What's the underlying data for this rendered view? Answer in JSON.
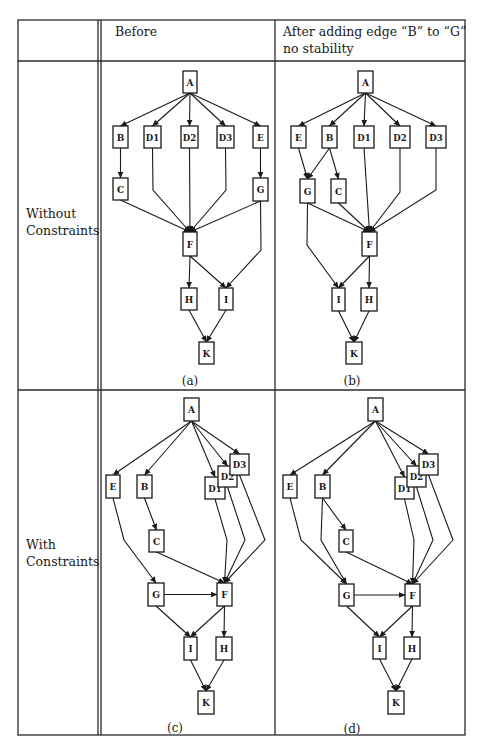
{
  "table": {
    "header": {
      "col1": "",
      "col2": "Before",
      "col3_line1": "After adding edge “B” to “G”",
      "col3_line2": "no stability"
    },
    "rows": [
      {
        "label_line1": "Without",
        "label_line2": "Constraints"
      },
      {
        "label_line1": "With",
        "label_line2": "Constraints"
      }
    ]
  },
  "graphs": [
    {
      "id": "a",
      "caption": "(a)",
      "caption_pos": [
        190,
        381
      ],
      "nodes": {
        "A": [
          183,
          71,
          14,
          22
        ],
        "B": [
          113,
          126,
          15,
          22
        ],
        "D1": [
          144,
          126,
          17,
          22
        ],
        "D2": [
          181,
          126,
          17,
          22
        ],
        "D3": [
          217,
          126,
          17,
          22
        ],
        "E": [
          253,
          126,
          15,
          22
        ],
        "C": [
          113,
          178,
          15,
          22
        ],
        "G": [
          253,
          178,
          15,
          23
        ],
        "F": [
          183,
          232,
          14,
          24
        ],
        "H": [
          181,
          288,
          16,
          22
        ],
        "I": [
          219,
          288,
          14,
          22
        ],
        "K": [
          199,
          342,
          15,
          22
        ]
      },
      "edges": [
        [
          "A",
          "B"
        ],
        [
          "A",
          "D1"
        ],
        [
          "A",
          "D2"
        ],
        [
          "A",
          "D3"
        ],
        [
          "A",
          "E"
        ],
        [
          "B",
          "C"
        ],
        [
          "E",
          "G"
        ],
        [
          "C",
          "F"
        ],
        [
          "D1",
          "F",
          [
            [
              153,
              190
            ]
          ]
        ],
        [
          "D2",
          "F"
        ],
        [
          "D3",
          "F",
          [
            [
              226,
              190
            ]
          ]
        ],
        [
          "G",
          "F"
        ],
        [
          "F",
          "H"
        ],
        [
          "F",
          "I"
        ],
        [
          "G",
          "I",
          [
            [
              261,
              250
            ]
          ]
        ],
        [
          "H",
          "K"
        ],
        [
          "I",
          "K"
        ]
      ]
    },
    {
      "id": "b",
      "caption": "(b)",
      "caption_pos": [
        352,
        381
      ],
      "nodes": {
        "A": [
          358,
          71,
          15,
          22
        ],
        "E": [
          291,
          126,
          15,
          22
        ],
        "B": [
          322,
          126,
          15,
          22
        ],
        "D1": [
          354,
          126,
          20,
          22
        ],
        "D2": [
          390,
          126,
          20,
          22
        ],
        "D3": [
          426,
          126,
          20,
          22
        ],
        "G": [
          300,
          179,
          15,
          24
        ],
        "C": [
          331,
          179,
          15,
          24
        ],
        "F": [
          362,
          232,
          15,
          24
        ],
        "I": [
          332,
          288,
          13,
          23
        ],
        "H": [
          361,
          288,
          16,
          23
        ],
        "K": [
          346,
          342,
          16,
          22
        ]
      },
      "edges": [
        [
          "A",
          "E"
        ],
        [
          "A",
          "B"
        ],
        [
          "A",
          "D1"
        ],
        [
          "A",
          "D2"
        ],
        [
          "A",
          "D3"
        ],
        [
          "E",
          "G"
        ],
        [
          "B",
          "G"
        ],
        [
          "B",
          "C"
        ],
        [
          "G",
          "F"
        ],
        [
          "C",
          "F"
        ],
        [
          "D1",
          "F"
        ],
        [
          "D2",
          "F",
          [
            [
              400,
              192
            ]
          ]
        ],
        [
          "D3",
          "F",
          [
            [
              436,
              190
            ]
          ]
        ],
        [
          "G",
          "I",
          [
            [
              307,
              245
            ]
          ]
        ],
        [
          "F",
          "I"
        ],
        [
          "F",
          "H"
        ],
        [
          "I",
          "K"
        ],
        [
          "H",
          "K"
        ]
      ]
    },
    {
      "id": "c",
      "caption": "(c)",
      "caption_pos": [
        175,
        728
      ],
      "nodes": {
        "A": [
          184,
          398,
          15,
          23
        ],
        "E": [
          106,
          475,
          14,
          23
        ],
        "B": [
          137,
          475,
          15,
          23
        ],
        "D1": [
          205,
          477,
          20,
          22
        ],
        "D2": [
          218,
          466,
          19,
          21
        ],
        "D3": [
          230,
          454,
          19,
          21
        ],
        "C": [
          149,
          530,
          15,
          22
        ],
        "G": [
          148,
          583,
          16,
          23
        ],
        "F": [
          217,
          583,
          15,
          23
        ],
        "I": [
          184,
          637,
          13,
          23
        ],
        "H": [
          216,
          637,
          16,
          23
        ],
        "K": [
          198,
          691,
          16,
          23
        ]
      },
      "edges": [
        [
          "A",
          "E"
        ],
        [
          "A",
          "B"
        ],
        [
          "A",
          "D1"
        ],
        [
          "A",
          "D2"
        ],
        [
          "A",
          "D3"
        ],
        [
          "B",
          "C"
        ],
        [
          "E",
          "G",
          [
            [
              124,
              540
            ]
          ]
        ],
        [
          "C",
          "F"
        ],
        [
          "D1",
          "F",
          [
            [
              227,
              540
            ]
          ]
        ],
        [
          "D2",
          "F",
          [
            [
              245,
              540
            ]
          ]
        ],
        [
          "D3",
          "F",
          [
            [
              265,
              540
            ]
          ]
        ],
        [
          "G",
          "F"
        ],
        [
          "G",
          "I"
        ],
        [
          "F",
          "I"
        ],
        [
          "F",
          "H"
        ],
        [
          "I",
          "K"
        ],
        [
          "H",
          "K"
        ]
      ]
    },
    {
      "id": "d",
      "caption": "(d)",
      "caption_pos": [
        352,
        729
      ],
      "nodes": {
        "A": [
          368,
          398,
          15,
          23
        ],
        "E": [
          283,
          475,
          14,
          23
        ],
        "B": [
          315,
          475,
          15,
          23
        ],
        "D1": [
          395,
          477,
          19,
          22
        ],
        "D2": [
          407,
          466,
          19,
          21
        ],
        "D3": [
          419,
          454,
          19,
          21
        ],
        "C": [
          339,
          530,
          14,
          22
        ],
        "G": [
          339,
          584,
          15,
          22
        ],
        "F": [
          405,
          584,
          15,
          22
        ],
        "I": [
          373,
          637,
          13,
          22
        ],
        "H": [
          404,
          637,
          16,
          22
        ],
        "K": [
          388,
          691,
          16,
          23
        ]
      },
      "edges": [
        [
          "A",
          "E"
        ],
        [
          "A",
          "B"
        ],
        [
          "A",
          "D1"
        ],
        [
          "A",
          "D2"
        ],
        [
          "A",
          "D3"
        ],
        [
          "B",
          "C"
        ],
        [
          "B",
          "G",
          [
            [
              321,
              540
            ]
          ]
        ],
        [
          "E",
          "G",
          [
            [
              301,
              540
            ]
          ]
        ],
        [
          "C",
          "F"
        ],
        [
          "D1",
          "F",
          [
            [
              414,
              540
            ]
          ]
        ],
        [
          "D2",
          "F",
          [
            [
              433,
              540
            ]
          ]
        ],
        [
          "D3",
          "F",
          [
            [
              453,
              540
            ]
          ]
        ],
        [
          "G",
          "F"
        ],
        [
          "G",
          "I"
        ],
        [
          "F",
          "I"
        ],
        [
          "F",
          "H"
        ],
        [
          "I",
          "K"
        ],
        [
          "H",
          "K"
        ]
      ]
    }
  ]
}
